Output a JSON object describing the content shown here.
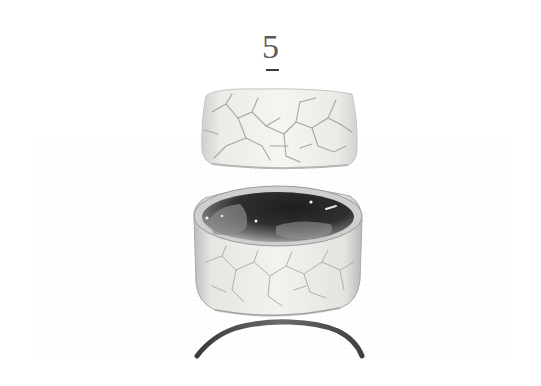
{
  "figure": {
    "number": "5",
    "parts": [
      {
        "name": "lid",
        "description": "crackle-glazed cream lid"
      },
      {
        "name": "bowl",
        "description": "cylindrical bowl with dark glazed interior and crackled exterior"
      },
      {
        "name": "ring",
        "description": "dark ring foot / stand"
      }
    ]
  },
  "colors": {
    "background": "#ffffff",
    "glaze": "#f1efe9",
    "crackle": "#a9a9a9",
    "interior_dark": "#2a2a2a",
    "ring": "#5a5a5a"
  }
}
